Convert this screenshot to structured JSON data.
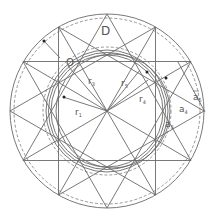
{
  "diagram": {
    "title": "",
    "center": {
      "x": 107,
      "y": 111
    },
    "colors": {
      "line": "#6a6a6a",
      "dashed": "#8a8a8a",
      "label": "#555555",
      "background": "#ffffff"
    },
    "labels": {
      "D": "D",
      "O": "O",
      "r1": "r",
      "r1_sub": "1",
      "r3": "r",
      "r3_sub": "3",
      "r5": "r",
      "r5_sub": "5",
      "r4": "r",
      "r4_sub": "4",
      "a5": "a",
      "a5_sub": "5",
      "a4": "a",
      "a4_sub": "4",
      "a3": "a",
      "a3_sub": "3"
    }
  }
}
